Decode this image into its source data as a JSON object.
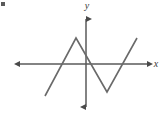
{
  "figure": {
    "name": "piecewise-linear-zigzag-graph",
    "background_color": "#ffffff",
    "width": 167,
    "height": 117,
    "corner_mark": {
      "name": "corner-tick-mark",
      "color": "#5a5a5a"
    }
  },
  "axes": {
    "origin": {
      "x": 86,
      "y": 64
    },
    "x_axis": {
      "label": "x",
      "label_x": 158,
      "label_y": 64,
      "start_x": 14,
      "end_x": 152,
      "y": 64,
      "color": "#5a5a5a",
      "arrow_both_ends": true
    },
    "y_axis": {
      "label": "y",
      "label_x": 87,
      "label_y": 8,
      "x": 86,
      "start_y": 13,
      "end_y": 112,
      "color": "#5a5a5a",
      "arrow_both_ends": true
    }
  },
  "chart_data": {
    "type": "line",
    "title": "",
    "subtitle": "",
    "xlabel": "x",
    "ylabel": "y",
    "grid": false,
    "legend": null,
    "series": [
      {
        "name": "zigzag",
        "color": "#6a6a6a",
        "line_width": 1.6,
        "points_px": [
          {
            "x": 45,
            "y": 96
          },
          {
            "x": 76,
            "y": 38
          },
          {
            "x": 107,
            "y": 92
          },
          {
            "x": 137,
            "y": 38
          }
        ],
        "points_graph": [
          {
            "x": -2.0,
            "y": -1.2
          },
          {
            "x": -0.65,
            "y": 1.0
          },
          {
            "x": 0.7,
            "y": -1.05
          },
          {
            "x": 2.0,
            "y": 1.0
          }
        ],
        "x_intercepts_px": [
          60,
          86,
          121
        ],
        "x_intercepts_graph": [
          -1.15,
          0,
          1.5
        ]
      }
    ],
    "xlim": [
      -3.2,
      3.0
    ],
    "ylim": [
      -2.0,
      2.0
    ],
    "annotations": []
  }
}
